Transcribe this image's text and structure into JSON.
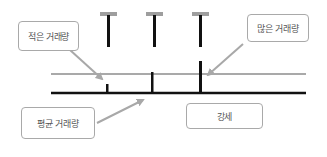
{
  "diagram": {
    "labels": {
      "low_volume": "적은 거래량",
      "high_volume": "많은 거래량",
      "average_volume": "평균 거래량",
      "bullish": "강세"
    },
    "colors": {
      "bar": "#111111",
      "cap": "#9e9e9e",
      "average_line": "#8c8c8c",
      "baseline": "#111111",
      "arrow": "#a8a8a8",
      "box_border": "#a9a9a9",
      "text": "#555555"
    },
    "volume_bars": [
      {
        "name": "low",
        "relative_height": 0.43
      },
      {
        "name": "average",
        "relative_height": 1.0
      },
      {
        "name": "high",
        "relative_height": 1.52
      }
    ]
  }
}
